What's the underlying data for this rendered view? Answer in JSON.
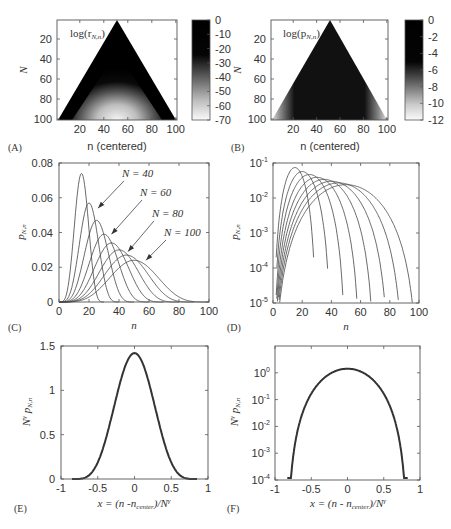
{
  "figure": {
    "panels": [
      "(A)",
      "(B)",
      "(C)",
      "(D)",
      "(E)",
      "(F)"
    ]
  },
  "chart_data": [
    {
      "id": "A",
      "type": "heatmap",
      "panel_label": "(A)",
      "title": "log(r_{N,n})",
      "inset_label": "log(r",
      "inset_sub": "N,n",
      "xlabel": "n (centered)",
      "ylabel": "N",
      "xticks": [
        20,
        40,
        60,
        80,
        100
      ],
      "yticks": [
        20,
        40,
        60,
        80,
        100
      ],
      "xlim": [
        1,
        101
      ],
      "ylim": [
        1,
        101
      ],
      "y_inverted": true,
      "shape": "triangle apex at n=51,N=1 widening to n=1..101 at N=100",
      "colorbar": {
        "ticks": [
          0,
          -10,
          -20,
          -30,
          -40,
          -50,
          -60,
          -70
        ],
        "range": [
          -70,
          0
        ],
        "colormap": "gray (black=0, white=-70)"
      },
      "description": "Black near triangle edges, lighter (to ~-70) toward bottom center"
    },
    {
      "id": "B",
      "type": "heatmap",
      "panel_label": "(B)",
      "title": "log(p_{N,n})",
      "inset_label": "log(p",
      "inset_sub": "N,n",
      "xlabel": "n (centered)",
      "ylabel": "N",
      "xticks": [
        20,
        40,
        60,
        80,
        100
      ],
      "yticks": [
        20,
        40,
        60,
        80,
        100
      ],
      "xlim": [
        1,
        101
      ],
      "ylim": [
        1,
        101
      ],
      "y_inverted": true,
      "colorbar": {
        "ticks": [
          0,
          -2,
          -4,
          -6,
          -8,
          -10,
          -12
        ],
        "range": [
          -12,
          0
        ],
        "colormap": "gray (black=0, white=-12)"
      },
      "description": "Black in triangle interior, gray fading near triangle edges"
    },
    {
      "id": "C",
      "type": "line",
      "panel_label": "(C)",
      "xlabel": "n",
      "ylabel": "p_{N,n}",
      "ylabel_main": "p",
      "ylabel_sub": "N,n",
      "xlim": [
        0,
        100
      ],
      "ylim": [
        0,
        0.08
      ],
      "xticks": [
        0,
        20,
        40,
        60,
        80,
        100
      ],
      "yticks": [
        "0",
        "0.02",
        "0.04",
        "0.06",
        "0.08"
      ],
      "ytick_values": [
        0,
        0.02,
        0.04,
        0.06,
        0.08
      ],
      "series": [
        {
          "N": 30,
          "peak_n": 15,
          "peak_p": 0.074,
          "end_n": 30
        },
        {
          "N": 40,
          "peak_n": 20,
          "peak_p": 0.057,
          "end_n": 40
        },
        {
          "N": 50,
          "peak_n": 25,
          "peak_p": 0.047,
          "end_n": 50
        },
        {
          "N": 60,
          "peak_n": 30,
          "peak_p": 0.039,
          "end_n": 60
        },
        {
          "N": 70,
          "peak_n": 35,
          "peak_p": 0.034,
          "end_n": 70
        },
        {
          "N": 80,
          "peak_n": 40,
          "peak_p": 0.03,
          "end_n": 80
        },
        {
          "N": 90,
          "peak_n": 45,
          "peak_p": 0.027,
          "end_n": 90
        },
        {
          "N": 100,
          "peak_n": 50,
          "peak_p": 0.024,
          "end_n": 100
        }
      ],
      "annotations": [
        {
          "text": "N = 40",
          "arrow_to": [
            26,
            0.054
          ],
          "text_at": [
            42,
            0.072
          ]
        },
        {
          "text": "N = 60",
          "arrow_to": [
            35,
            0.039
          ],
          "text_at": [
            54,
            0.061
          ]
        },
        {
          "text": "N = 80",
          "arrow_to": [
            46,
            0.029
          ],
          "text_at": [
            62,
            0.049
          ]
        },
        {
          "text": "N = 100",
          "arrow_to": [
            58,
            0.024
          ],
          "text_at": [
            70,
            0.038
          ]
        }
      ],
      "grid": false
    },
    {
      "id": "D",
      "type": "line",
      "panel_label": "(D)",
      "xlabel": "n",
      "ylabel": "p_{N,n}",
      "ylabel_main": "p",
      "ylabel_sub": "N,n",
      "yscale": "log",
      "xlim": [
        0,
        100
      ],
      "ylim": [
        1e-05,
        0.1
      ],
      "xticks": [
        0,
        20,
        40,
        60,
        80,
        100
      ],
      "yticks": [
        "10-5",
        "10-4",
        "10-3",
        "10-2",
        "10-1"
      ],
      "ytick_exponents": [
        -5,
        -4,
        -3,
        -2,
        -1
      ],
      "series": [
        {
          "N": 30,
          "end_n": 30,
          "end_p": 0.0002
        },
        {
          "N": 40,
          "end_n": 40,
          "end_p": 5e-05
        },
        {
          "N": 50,
          "end_n": 50,
          "end_p": 1.5e-05
        },
        {
          "N": 60,
          "end_n": 60,
          "end_p": 1e-05
        },
        {
          "N": 70,
          "end_n": 70,
          "end_p": 1e-05
        },
        {
          "N": 80,
          "end_n": 80,
          "end_p": 1e-05
        },
        {
          "N": 90,
          "end_n": 89,
          "end_p": 1e-05
        },
        {
          "N": 100,
          "end_n": 99,
          "end_p": 1e-05
        }
      ],
      "grid": false
    },
    {
      "id": "E",
      "type": "line",
      "panel_label": "(E)",
      "xlabel": "x = (n - n_center)/N^γ",
      "xlabel_parts": [
        "x = (n -n",
        "center",
        ")/N",
        "γ"
      ],
      "ylabel": "N^γ p_{N,n}",
      "ylabel_parts": [
        "N",
        "γ",
        " p",
        "N,n"
      ],
      "xlim": [
        -1,
        1
      ],
      "ylim": [
        0,
        1.5
      ],
      "xticks": [
        "-1",
        "-0.5",
        "0",
        "0.5",
        "1"
      ],
      "xtick_values": [
        -1,
        -0.5,
        0,
        0.5,
        1
      ],
      "yticks": [
        "0",
        "0.5",
        "1",
        "1.5"
      ],
      "ytick_values": [
        0,
        0.5,
        1,
        1.5
      ],
      "series": [
        {
          "name": "collapsed curves",
          "peak_x": 0,
          "peak_y": 1.42,
          "support": [
            -0.85,
            0.85
          ]
        }
      ],
      "grid": false
    },
    {
      "id": "F",
      "type": "line",
      "panel_label": "(F)",
      "xlabel": "x = (n - n_center)/N^γ",
      "xlabel_parts": [
        "x = (n - n",
        "center",
        ")/N",
        "γ"
      ],
      "ylabel": "N^γ p_{N,n}",
      "ylabel_parts": [
        "N",
        "γ",
        " p",
        "N,n"
      ],
      "yscale": "log",
      "xlim": [
        -1,
        1
      ],
      "ylim": [
        0.0001,
        10.0
      ],
      "xticks": [
        "-1",
        "-0.5",
        "0",
        "0.5",
        "1"
      ],
      "xtick_values": [
        -1,
        -0.5,
        0,
        0.5,
        1
      ],
      "yticks": [
        "10-4",
        "10-3",
        "10-2",
        "10-1",
        "100"
      ],
      "ytick_exponents": [
        -4,
        -3,
        -2,
        -1,
        0
      ],
      "series": [
        {
          "name": "collapsed curves",
          "peak_x": 0,
          "peak_y": 1.42,
          "ends": [
            [
              -0.83,
              0.0002
            ],
            [
              0.83,
              0.00012
            ]
          ]
        }
      ],
      "grid": false
    }
  ]
}
